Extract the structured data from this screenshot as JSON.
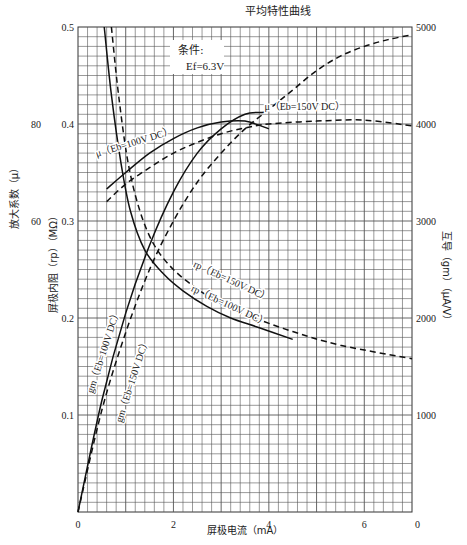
{
  "chart_data": {
    "type": "line",
    "title": "平均特性曲线",
    "xlabel": "屏极电流（mA）",
    "ylabel_left_outer": "放大系数（μ）",
    "ylabel_left_inner": "屏极内阻（rp）（MΩ）",
    "ylabel_right": "互导（gm）（μA/V）",
    "xlim": [
      0,
      7
    ],
    "ylim_rp": [
      0,
      0.5
    ],
    "ylim_gm": [
      0,
      5000
    ],
    "x_ticks": [
      0,
      2,
      4,
      6
    ],
    "x_tick_labels": [
      "0",
      "2",
      "4",
      "6"
    ],
    "rp_ticks": [
      0.1,
      0.2,
      0.3,
      0.4,
      0.5
    ],
    "rp_tick_labels": [
      "0.1",
      "0.2",
      "0.3",
      "0.4",
      "0.5"
    ],
    "mu_ticks": [
      60,
      80
    ],
    "mu_tick_labels": [
      "60",
      "80"
    ],
    "gm_ticks": [
      0,
      1000,
      2000,
      3000,
      4000,
      5000
    ],
    "gm_tick_labels": [
      "0",
      "1000",
      "2000",
      "3000",
      "4000",
      "5000"
    ],
    "grid": true,
    "annotation": {
      "line1": "条件:",
      "line2": "Ef=6.3V"
    },
    "series": [
      {
        "name": "μ (Eb=100V DC)",
        "style": "solid",
        "axis": "rp",
        "x": [
          0.6,
          1.0,
          1.5,
          2.0,
          2.5,
          3.0,
          3.5,
          4.0
        ],
        "y": [
          0.333,
          0.35,
          0.37,
          0.385,
          0.396,
          0.402,
          0.403,
          0.395
        ]
      },
      {
        "name": "μ (Eb=150V DC)",
        "style": "dashed",
        "axis": "rp",
        "x": [
          0.6,
          1.0,
          1.5,
          2.0,
          2.5,
          3.0,
          3.5,
          4.0,
          5.0,
          6.0,
          7.0
        ],
        "y": [
          0.32,
          0.338,
          0.355,
          0.37,
          0.381,
          0.39,
          0.396,
          0.4,
          0.403,
          0.404,
          0.398
        ]
      },
      {
        "name": "rp (Eb=100V DC)",
        "style": "solid",
        "axis": "rp",
        "x": [
          0.55,
          0.7,
          0.9,
          1.1,
          1.4,
          1.8,
          2.2,
          2.7,
          3.2,
          3.8,
          4.5
        ],
        "y": [
          0.5,
          0.43,
          0.36,
          0.31,
          0.27,
          0.245,
          0.228,
          0.212,
          0.2,
          0.19,
          0.178
        ]
      },
      {
        "name": "rp (Eb=150V DC)",
        "style": "dashed",
        "axis": "rp",
        "x": [
          0.7,
          0.85,
          1.05,
          1.3,
          1.6,
          2.0,
          2.5,
          3.0,
          3.6,
          4.5,
          5.5,
          7.0
        ],
        "y": [
          0.5,
          0.43,
          0.36,
          0.31,
          0.275,
          0.25,
          0.23,
          0.215,
          0.202,
          0.186,
          0.172,
          0.158
        ]
      },
      {
        "name": "gm (Eb=100V DC)",
        "style": "solid",
        "axis": "gm",
        "x": [
          0.0,
          0.5,
          1.0,
          1.5,
          2.0,
          2.5,
          3.0,
          3.5,
          3.9
        ],
        "y": [
          0,
          1150,
          2050,
          2750,
          3300,
          3700,
          3950,
          4100,
          4120
        ]
      },
      {
        "name": "gm (Eb=150V DC)",
        "style": "dashed",
        "axis": "gm",
        "x": [
          0.0,
          0.5,
          1.0,
          1.5,
          2.0,
          2.5,
          3.0,
          3.5,
          4.0,
          4.5,
          5.0,
          5.5,
          6.0,
          6.5,
          7.0
        ],
        "y": [
          0,
          1050,
          1850,
          2500,
          3000,
          3400,
          3700,
          3950,
          4150,
          4350,
          4550,
          4700,
          4800,
          4870,
          4920
        ]
      }
    ],
    "curve_labels": [
      {
        "text": "μ（Eb=100V DC）",
        "x": 1.2,
        "y": 0.378,
        "rot": -17
      },
      {
        "text": "μ（Eb=150V DC）",
        "x": 4.75,
        "y": 0.414,
        "rot": 0
      },
      {
        "text": "rp（Eb=150V DC）",
        "x": 3.2,
        "y": 0.235,
        "rot": 25
      },
      {
        "text": "rp（Eb=100V DC）",
        "x": 3.15,
        "y": 0.21,
        "rot": 25
      },
      {
        "text": "gm（Eb=100V DC）",
        "x": 0.6,
        "y": 0.165,
        "rot": -72
      },
      {
        "text": "gm（Eb=150V DC）",
        "x": 1.2,
        "y": 0.135,
        "rot": -72
      }
    ]
  },
  "labels": {
    "title": "平均特性曲线",
    "xlabel": "屏极电流（mA）",
    "mu_axis": "放大系数（μ）",
    "rp_axis": "屏极内阻（rp）（MΩ）",
    "gm_axis": "互导（gm）（μA/V）",
    "cond1": "条件:",
    "cond2": "Ef=6.3V"
  }
}
